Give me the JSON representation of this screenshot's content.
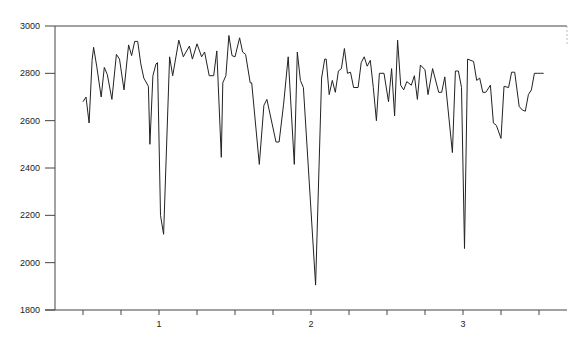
{
  "chart_data": {
    "type": "line",
    "title": "",
    "xlabel": "",
    "ylabel": "",
    "xlim": [
      0.32,
      3.71
    ],
    "ylim": [
      1800,
      3000
    ],
    "grid": false,
    "legend": null,
    "x_ticks": [
      1,
      2,
      3
    ],
    "x_minor_step": 0.25,
    "y_ticks": [
      1800,
      2000,
      2200,
      2400,
      2600,
      2800,
      3000
    ],
    "series": [
      {
        "name": "series-1",
        "color": "#222222",
        "x": [
          0.5,
          0.52,
          0.54,
          0.56,
          0.57,
          0.59,
          0.62,
          0.64,
          0.66,
          0.69,
          0.72,
          0.74,
          0.77,
          0.8,
          0.82,
          0.84,
          0.86,
          0.88,
          0.9,
          0.93,
          0.94,
          0.96,
          0.98,
          0.99,
          1.01,
          1.03,
          1.07,
          1.07,
          1.09,
          1.13,
          1.16,
          1.2,
          1.22,
          1.25,
          1.28,
          1.3,
          1.33,
          1.36,
          1.38,
          1.41,
          1.42,
          1.44,
          1.46,
          1.48,
          1.5,
          1.53,
          1.55,
          1.57,
          1.6,
          1.61,
          1.66,
          1.69,
          1.71,
          1.77,
          1.79,
          1.82,
          1.85,
          1.89,
          1.91,
          1.93,
          1.95,
          2.03,
          2.07,
          2.09,
          2.1,
          2.12,
          2.14,
          2.16,
          2.18,
          2.2,
          2.22,
          2.24,
          2.26,
          2.28,
          2.31,
          2.33,
          2.35,
          2.37,
          2.39,
          2.41,
          2.43,
          2.45,
          2.48,
          2.51,
          2.53,
          2.55,
          2.57,
          2.59,
          2.61,
          2.63,
          2.66,
          2.68,
          2.7,
          2.72,
          2.75,
          2.77,
          2.8,
          2.84,
          2.86,
          2.88,
          2.93,
          2.95,
          2.97,
          2.99,
          3.01,
          3.03,
          3.07,
          3.09,
          3.11,
          3.13,
          3.15,
          3.18,
          3.2,
          3.22,
          3.25,
          3.27,
          3.3,
          3.32,
          3.34,
          3.37,
          3.39,
          3.41,
          3.43,
          3.45,
          3.47,
          3.49,
          3.51,
          3.53
        ],
        "y": [
          2680,
          2700,
          2590,
          2855,
          2910,
          2830,
          2700,
          2825,
          2795,
          2690,
          2880,
          2860,
          2730,
          2920,
          2875,
          2935,
          2935,
          2840,
          2780,
          2745,
          2500,
          2790,
          2840,
          2845,
          2200,
          2120,
          2870,
          2870,
          2790,
          2940,
          2870,
          2915,
          2860,
          2925,
          2870,
          2890,
          2790,
          2790,
          2895,
          2445,
          2760,
          2790,
          2960,
          2875,
          2870,
          2950,
          2890,
          2880,
          2760,
          2760,
          2415,
          2665,
          2690,
          2510,
          2510,
          2670,
          2870,
          2415,
          2890,
          2770,
          2740,
          1905,
          2780,
          2860,
          2860,
          2710,
          2770,
          2720,
          2810,
          2820,
          2905,
          2800,
          2805,
          2740,
          2740,
          2845,
          2870,
          2830,
          2855,
          2740,
          2600,
          2800,
          2800,
          2680,
          2820,
          2620,
          2940,
          2750,
          2730,
          2765,
          2750,
          2790,
          2690,
          2835,
          2815,
          2710,
          2820,
          2720,
          2720,
          2785,
          2465,
          2810,
          2810,
          2740,
          2060,
          2860,
          2850,
          2770,
          2780,
          2720,
          2720,
          2750,
          2590,
          2580,
          2525,
          2745,
          2740,
          2805,
          2805,
          2660,
          2645,
          2640,
          2710,
          2730,
          2800,
          2800,
          2800,
          2800
        ]
      }
    ]
  },
  "axes": {
    "y_labels": [
      "3000",
      "2800",
      "2600",
      "2400",
      "2200",
      "2000",
      "1800"
    ],
    "x_labels": [
      "1",
      "2",
      "3"
    ]
  }
}
